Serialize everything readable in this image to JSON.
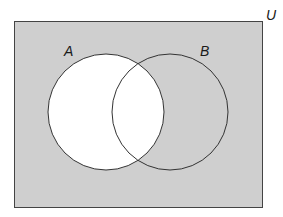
{
  "diagram": {
    "type": "venn",
    "universe_label": "U",
    "sets": [
      {
        "label": "A"
      },
      {
        "label": "B"
      }
    ],
    "shaded_region": "complement of (B \\ A) relative to U — shaded: U outside A",
    "colors": {
      "universe_fill": "#cfcfcf",
      "set_a_fill": "#ffffff",
      "stroke": "#333333"
    }
  }
}
